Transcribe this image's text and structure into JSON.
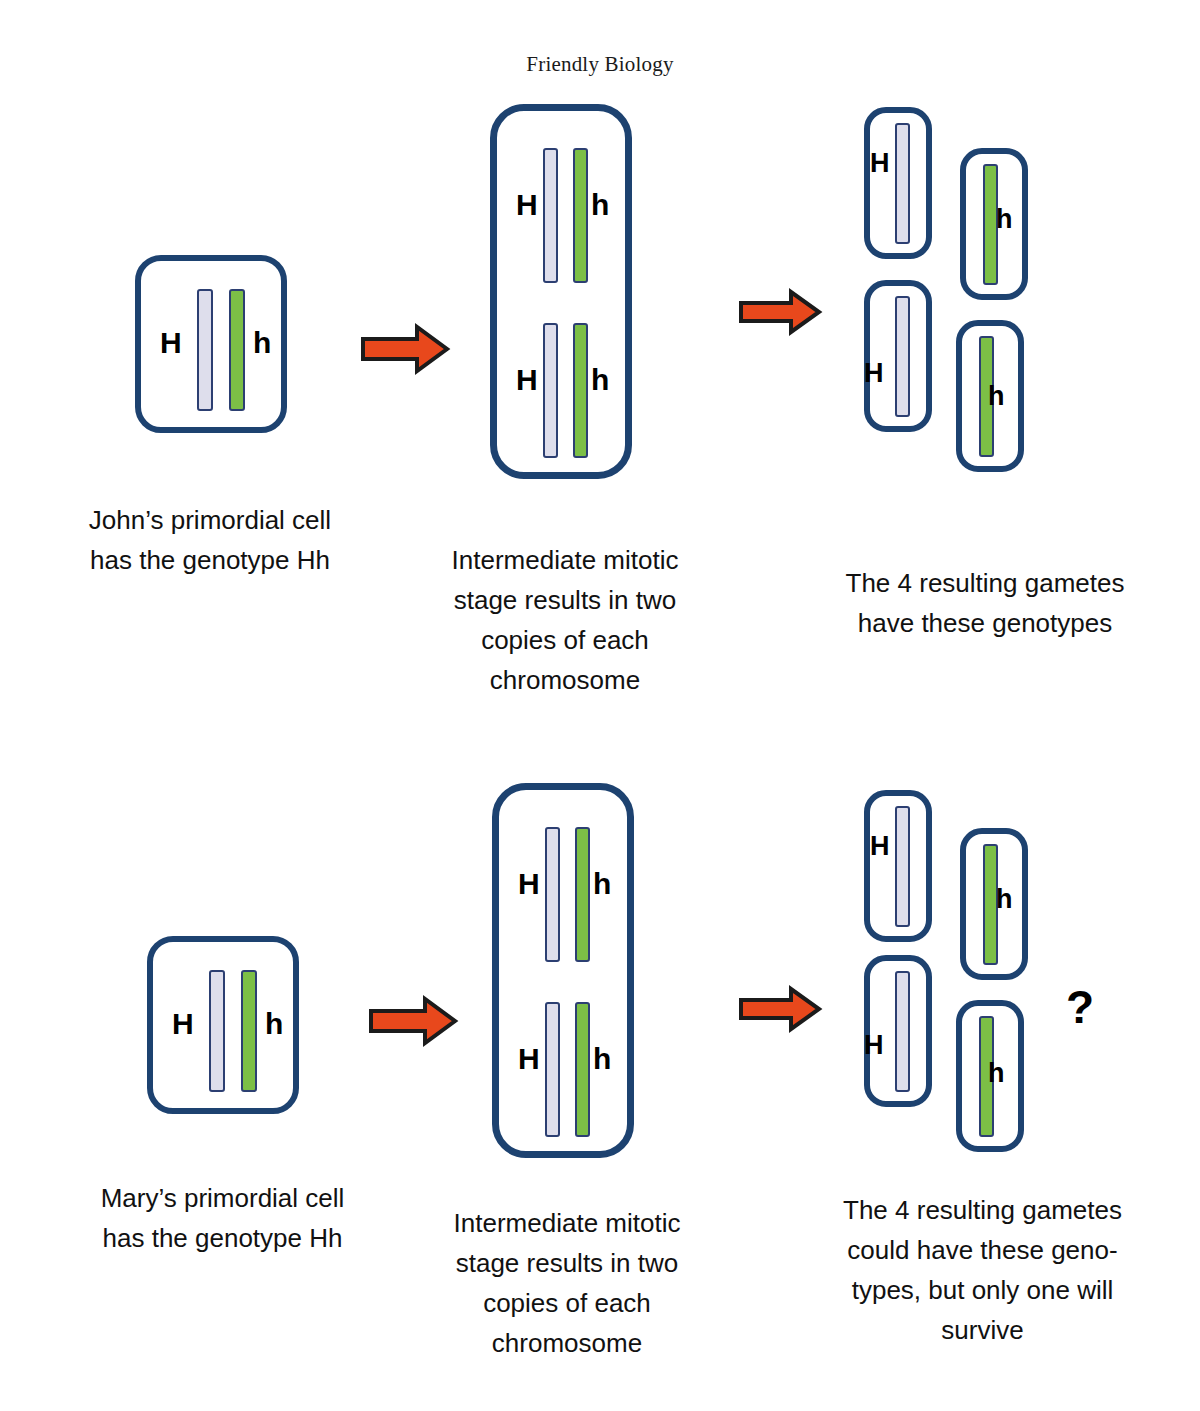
{
  "header": {
    "title": "Friendly Biology"
  },
  "symbols": {
    "dominant": "H",
    "recessive": "h",
    "question": "?"
  },
  "colors": {
    "cell_border": "#1d4270",
    "chromosome_light": "#dedeec",
    "chromosome_green": "#7cbf46",
    "chromosome_border": "#2c3f72",
    "arrow_fill": "#e8481c",
    "arrow_outline": "#1b1b1b",
    "text": "#111111",
    "background": "#ffffff"
  },
  "rows": [
    {
      "id": "john-row",
      "stage1": {
        "name": "johns-primordial-cell",
        "alleles": [
          "H",
          "h"
        ],
        "caption": "John’s primordial cell\nhas the genotype Hh"
      },
      "stage2": {
        "name": "john-intermediate-cell",
        "alleles_top": [
          "H",
          "h"
        ],
        "alleles_bottom": [
          "H",
          "h"
        ],
        "caption": "Intermediate mitotic\nstage results in two\ncopies of each\nchromosome"
      },
      "stage3": {
        "name": "john-gametes",
        "gametes": [
          {
            "label": "H",
            "type": "light"
          },
          {
            "label": "h",
            "type": "green"
          },
          {
            "label": "H",
            "type": "light"
          },
          {
            "label": "h",
            "type": "green"
          }
        ],
        "caption": "The 4 resulting gametes\nhave these genotypes",
        "question_mark": ""
      },
      "arrow1_label": "arrow-right",
      "arrow2_label": "arrow-right"
    },
    {
      "id": "mary-row",
      "stage1": {
        "name": "marys-primordial-cell",
        "alleles": [
          "H",
          "h"
        ],
        "caption": "Mary’s primordial cell\nhas the genotype Hh"
      },
      "stage2": {
        "name": "mary-intermediate-cell",
        "alleles_top": [
          "H",
          "h"
        ],
        "alleles_bottom": [
          "H",
          "h"
        ],
        "caption": "Intermediate mitotic\nstage results in two\ncopies of each\nchromosome"
      },
      "stage3": {
        "name": "mary-gametes",
        "gametes": [
          {
            "label": "H",
            "type": "light"
          },
          {
            "label": "h",
            "type": "green"
          },
          {
            "label": "H",
            "type": "light"
          },
          {
            "label": "h",
            "type": "green"
          }
        ],
        "caption": "The 4 resulting gametes\ncould have these geno-\ntypes, but only one will\nsurvive",
        "question_mark": "?"
      },
      "arrow1_label": "arrow-right",
      "arrow2_label": "arrow-right"
    }
  ]
}
